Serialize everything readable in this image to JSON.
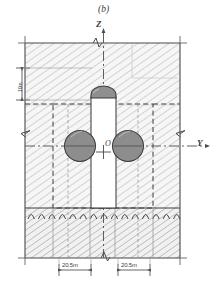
{
  "figure": {
    "panel_label": "(b)",
    "caption_position": "top-center",
    "axes": {
      "vertical": {
        "name": "Z",
        "label": "Z",
        "direction": "up"
      },
      "horizontal": {
        "name": "Y",
        "label": "Y",
        "direction": "right"
      },
      "origin": {
        "label": "O"
      }
    },
    "dimensions": [
      {
        "id": "depth-left",
        "label": "10m",
        "orientation": "vertical",
        "side": "left"
      },
      {
        "id": "offset-left",
        "label": "20.5m",
        "orientation": "horizontal",
        "side": "bottom-left"
      },
      {
        "id": "offset-right",
        "label": "20.5m",
        "orientation": "horizontal",
        "side": "bottom-right"
      }
    ],
    "regions": [
      {
        "id": "soil-domain",
        "name": "soil-hatched-domain",
        "fill": "#f2f2f2",
        "hatch": "diagonal"
      },
      {
        "id": "bedrock",
        "name": "bedrock-hatched-layer",
        "fill": "#efefef",
        "hatch": "diagonal"
      },
      {
        "id": "inner-zone",
        "name": "inner-refined-zone",
        "stroke": "dashed"
      }
    ],
    "structure": {
      "shaft": {
        "name": "pile-shaft",
        "fill": "#ffffff"
      },
      "cap": {
        "name": "pile-dome-cap",
        "fill": "#909090"
      },
      "tunnel_left": {
        "name": "tunnel-bore-left",
        "fill": "#8d8d8d"
      },
      "tunnel_right": {
        "name": "tunnel-bore-right",
        "fill": "#8d8d8d"
      }
    },
    "colors": {
      "line": "#4a4a4a",
      "hatch": "#a8a8a8",
      "fill_light": "#f3f3f3",
      "fill_gray": "#8d8d8d",
      "fill_white": "#ffffff",
      "dashed": "#3f3f3f"
    }
  }
}
